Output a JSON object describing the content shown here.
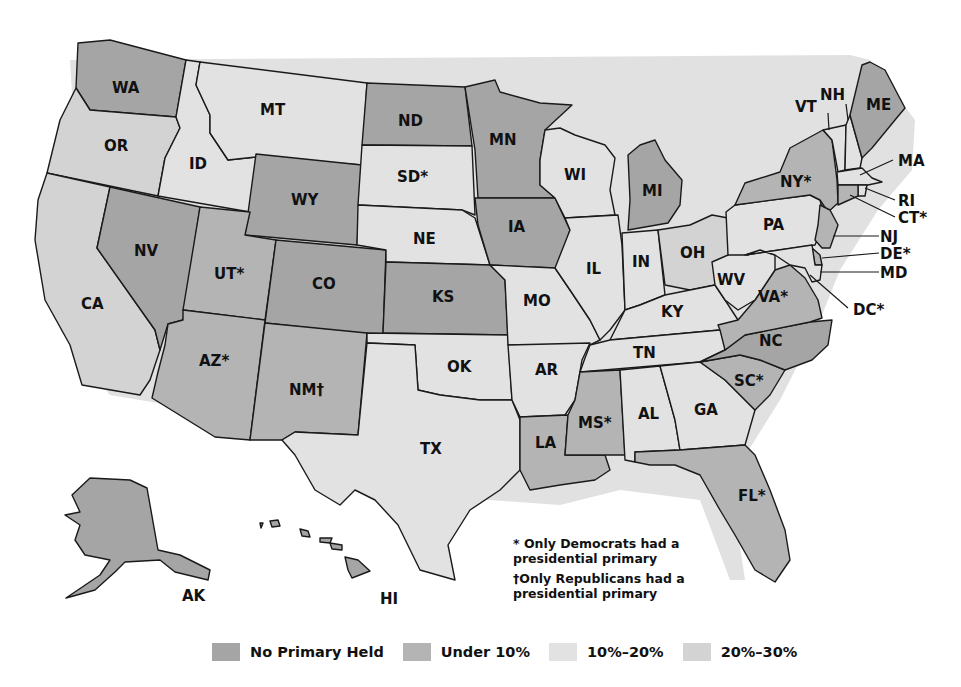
{
  "colors": {
    "no_primary": "#a5a5a5",
    "under_10": "#b4b4b4",
    "p10_20": "#e2e2e2",
    "p20_30": "#d3d3d3",
    "water": "#ffffff",
    "border": "#1a1a1a"
  },
  "legend": [
    {
      "key": "no_primary",
      "label": "No Primary Held",
      "color": "#a5a5a5"
    },
    {
      "key": "under_10",
      "label": "Under 10%",
      "color": "#b4b4b4"
    },
    {
      "key": "p10_20",
      "label": "10%–20%",
      "color": "#e2e2e2"
    },
    {
      "key": "p20_30",
      "label": "20%–30%",
      "color": "#d3d3d3"
    }
  ],
  "notes": {
    "democrats_only": "* Only Democrats had a presidential primary",
    "republicans_only": "†Only Republicans had a presidential primary"
  },
  "states": [
    {
      "abbr": "WA",
      "label": "WA",
      "category": "no_primary"
    },
    {
      "abbr": "OR",
      "label": "OR",
      "category": "p20_30"
    },
    {
      "abbr": "CA",
      "label": "CA",
      "category": "p20_30"
    },
    {
      "abbr": "ID",
      "label": "ID",
      "category": "p10_20"
    },
    {
      "abbr": "NV",
      "label": "NV",
      "category": "no_primary"
    },
    {
      "abbr": "MT",
      "label": "MT",
      "category": "p10_20"
    },
    {
      "abbr": "WY",
      "label": "WY",
      "category": "no_primary"
    },
    {
      "abbr": "UT",
      "label": "UT*",
      "category": "under_10"
    },
    {
      "abbr": "CO",
      "label": "CO",
      "category": "no_primary"
    },
    {
      "abbr": "AZ",
      "label": "AZ*",
      "category": "under_10"
    },
    {
      "abbr": "NM",
      "label": "NM†",
      "category": "under_10"
    },
    {
      "abbr": "ND",
      "label": "ND",
      "category": "no_primary"
    },
    {
      "abbr": "SD",
      "label": "SD*",
      "category": "p10_20"
    },
    {
      "abbr": "NE",
      "label": "NE",
      "category": "p10_20"
    },
    {
      "abbr": "KS",
      "label": "KS",
      "category": "no_primary"
    },
    {
      "abbr": "OK",
      "label": "OK",
      "category": "p10_20"
    },
    {
      "abbr": "TX",
      "label": "TX",
      "category": "p10_20"
    },
    {
      "abbr": "MN",
      "label": "MN",
      "category": "no_primary"
    },
    {
      "abbr": "IA",
      "label": "IA",
      "category": "no_primary"
    },
    {
      "abbr": "MO",
      "label": "MO",
      "category": "p10_20"
    },
    {
      "abbr": "AR",
      "label": "AR",
      "category": "p10_20"
    },
    {
      "abbr": "LA",
      "label": "LA",
      "category": "under_10"
    },
    {
      "abbr": "WI",
      "label": "WI",
      "category": "p10_20"
    },
    {
      "abbr": "IL",
      "label": "IL",
      "category": "p10_20"
    },
    {
      "abbr": "MI",
      "label": "MI",
      "category": "no_primary"
    },
    {
      "abbr": "IN",
      "label": "IN",
      "category": "p10_20"
    },
    {
      "abbr": "OH",
      "label": "OH",
      "category": "p20_30"
    },
    {
      "abbr": "KY",
      "label": "KY",
      "category": "p10_20"
    },
    {
      "abbr": "TN",
      "label": "TN",
      "category": "p10_20"
    },
    {
      "abbr": "MS",
      "label": "MS*",
      "category": "under_10"
    },
    {
      "abbr": "AL",
      "label": "AL",
      "category": "p10_20"
    },
    {
      "abbr": "GA",
      "label": "GA",
      "category": "p10_20"
    },
    {
      "abbr": "FL",
      "label": "FL*",
      "category": "under_10"
    },
    {
      "abbr": "SC",
      "label": "SC*",
      "category": "under_10"
    },
    {
      "abbr": "NC",
      "label": "NC",
      "category": "no_primary"
    },
    {
      "abbr": "VA",
      "label": "VA*",
      "category": "under_10"
    },
    {
      "abbr": "WV",
      "label": "WV",
      "category": "p10_20"
    },
    {
      "abbr": "PA",
      "label": "PA",
      "category": "p10_20"
    },
    {
      "abbr": "NY",
      "label": "NY*",
      "category": "under_10"
    },
    {
      "abbr": "VT",
      "label": "VT",
      "category": "p10_20"
    },
    {
      "abbr": "NH",
      "label": "NH",
      "category": "p10_20"
    },
    {
      "abbr": "ME",
      "label": "ME",
      "category": "no_primary"
    },
    {
      "abbr": "MA",
      "label": "MA",
      "category": "p10_20"
    },
    {
      "abbr": "RI",
      "label": "RI",
      "category": "p10_20"
    },
    {
      "abbr": "CT",
      "label": "CT*",
      "category": "under_10"
    },
    {
      "abbr": "NJ",
      "label": "NJ",
      "category": "under_10"
    },
    {
      "abbr": "DE",
      "label": "DE*",
      "category": "under_10"
    },
    {
      "abbr": "MD",
      "label": "MD",
      "category": "p10_20"
    },
    {
      "abbr": "DC",
      "label": "DC*",
      "category": "p10_20"
    },
    {
      "abbr": "AK",
      "label": "AK",
      "category": "no_primary"
    },
    {
      "abbr": "HI",
      "label": "HI",
      "category": "no_primary"
    }
  ]
}
